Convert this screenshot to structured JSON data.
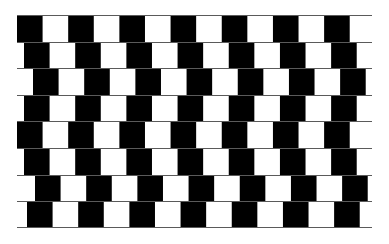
{
  "figure": {
    "name": "cafe-wall-illusion",
    "colors": {
      "tile_dark": "#000000",
      "tile_light": "#ffffff",
      "mortar": "#5a5a5a",
      "background": "#ffffff"
    },
    "grid": {
      "left": 17,
      "top": 15,
      "width": 355,
      "height": 213,
      "rows": 8,
      "row_height": 26.6,
      "tile_width": 25.6,
      "period": 51.2
    },
    "rows": [
      {
        "index": 0,
        "offset": 0
      },
      {
        "index": 1,
        "offset": 7
      },
      {
        "index": 2,
        "offset": 16
      },
      {
        "index": 3,
        "offset": 7
      },
      {
        "index": 4,
        "offset": 0
      },
      {
        "index": 5,
        "offset": 7
      },
      {
        "index": 6,
        "offset": 18
      },
      {
        "index": 7,
        "offset": 10
      }
    ]
  }
}
